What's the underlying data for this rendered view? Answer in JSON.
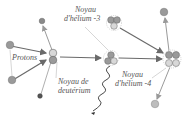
{
  "diagram": {
    "labels": {
      "protons": "Protons",
      "deuterium_line1": "Noyau de",
      "deuterium_line2": "deutérium",
      "helium3_line1": "Noyau",
      "helium3_line2": "d'hélium -3",
      "helium4_line1": "Noyau",
      "helium4_line2": "d'hélium -4"
    },
    "colors": {
      "proton": "#9a9a9a",
      "neutron": "#d8d8d8",
      "arrow": "#6a6a6a",
      "light_arrow": "#9a9a9a",
      "text": "#555555"
    }
  }
}
